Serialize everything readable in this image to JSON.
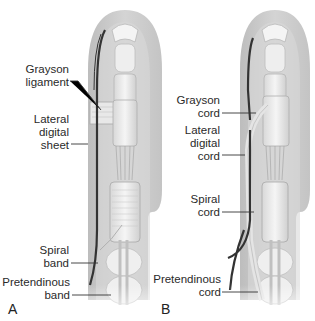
{
  "figure": {
    "panels": [
      {
        "id": "A",
        "label": "A",
        "callouts": [
          {
            "key": "grayson",
            "lines": [
              "Grayson",
              "ligament"
            ]
          },
          {
            "key": "lateral",
            "lines": [
              "Lateral",
              "digital",
              "sheet"
            ]
          },
          {
            "key": "spiral",
            "lines": [
              "Spiral",
              "band"
            ]
          },
          {
            "key": "pretendinous",
            "lines": [
              "Pretendinous",
              "band"
            ]
          }
        ]
      },
      {
        "id": "B",
        "label": "B",
        "callouts": [
          {
            "key": "grayson",
            "lines": [
              "Grayson",
              "cord"
            ]
          },
          {
            "key": "lateral",
            "lines": [
              "Lateral",
              "digital",
              "cord"
            ]
          },
          {
            "key": "spiral",
            "lines": [
              "Spiral",
              "cord"
            ]
          },
          {
            "key": "pretendinous",
            "lines": [
              "Pretendinous",
              "cord"
            ]
          }
        ]
      }
    ],
    "colors": {
      "skin": "#c9c9c9",
      "skin_light": "#e6e6e6",
      "bone": "#f2f2f2",
      "nerve": "#3a3a3a",
      "leader": "#333333",
      "text": "#2a2a2a"
    }
  }
}
